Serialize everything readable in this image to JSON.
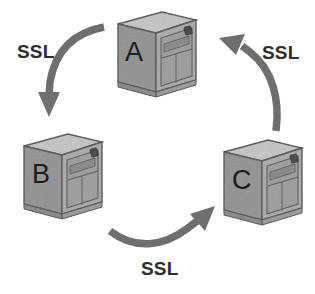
{
  "diagram": {
    "type": "network-topology",
    "background_color": "#ffffff",
    "nodes": [
      {
        "id": "A",
        "label": "A",
        "icon": "server-tower-icon",
        "position": {
          "x": 112,
          "y": 8,
          "width": 88,
          "height": 92
        },
        "label_position": {
          "x": 125,
          "y": 39
        }
      },
      {
        "id": "B",
        "label": "B",
        "icon": "server-tower-icon",
        "position": {
          "x": 18,
          "y": 130,
          "width": 88,
          "height": 92
        },
        "label_position": {
          "x": 32,
          "y": 161
        }
      },
      {
        "id": "C",
        "label": "C",
        "icon": "server-tower-icon",
        "position": {
          "x": 218,
          "y": 136,
          "width": 88,
          "height": 92
        },
        "label_position": {
          "x": 232,
          "y": 167
        }
      }
    ],
    "connections": [
      {
        "id": "a-to-b",
        "from": "A",
        "to": "B",
        "label": "SSL",
        "label_position": {
          "x": 17,
          "y": 42
        },
        "arrow_direction": "down-left"
      },
      {
        "id": "b-to-c",
        "from": "B",
        "to": "C",
        "label": "SSL",
        "label_position": {
          "x": 141,
          "y": 259
        },
        "arrow_direction": "right-up"
      },
      {
        "id": "c-to-a",
        "from": "C",
        "to": "A",
        "label": "SSL",
        "label_position": {
          "x": 262,
          "y": 43
        },
        "arrow_direction": "up-left"
      }
    ],
    "colors": {
      "arrow": "#6d6d6d",
      "label_text": "#2e2e2e",
      "node_letter": "#1c1c1c",
      "server_front": "#a8a8a8",
      "server_side": "#8f8f8f",
      "server_top": "#c4c4c4",
      "server_outline": "#5f5f5f",
      "server_panel": "#9c9c9c",
      "server_button": "#4a4a4a"
    }
  }
}
